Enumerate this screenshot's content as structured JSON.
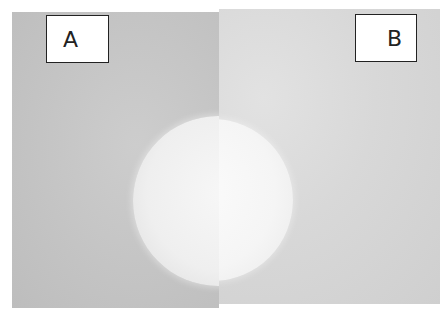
{
  "figure": {
    "panels": [
      {
        "id": "A",
        "label": "A",
        "background": "#c4c4c4",
        "disc_color": "#efefef"
      },
      {
        "id": "B",
        "label": "B",
        "background": "#d8d8d8",
        "disc_color": "#f5f5f5"
      }
    ]
  }
}
